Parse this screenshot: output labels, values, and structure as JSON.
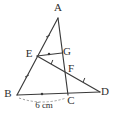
{
  "figure": {
    "type": "geometry-diagram",
    "background_color": "#ffffff",
    "stroke_color": "#3a3a3a",
    "label_color": "#2e2e2e",
    "width": 115,
    "height": 113
  },
  "points": [
    {
      "name": "A",
      "label": "A",
      "x": 58,
      "y": 18,
      "label_x": 58,
      "label_y": 11
    },
    {
      "name": "B",
      "label": "B",
      "x": 17,
      "y": 95,
      "label_x": 8,
      "label_y": 97
    },
    {
      "name": "C",
      "label": "C",
      "x": 68,
      "y": 95,
      "label_x": 71,
      "label_y": 104
    },
    {
      "name": "D",
      "label": "D",
      "x": 100,
      "y": 92,
      "label_x": 105,
      "label_y": 95
    },
    {
      "name": "E",
      "label": "E",
      "x": 37,
      "y": 56,
      "label_x": 29,
      "label_y": 57
    },
    {
      "name": "F",
      "label": "F",
      "x": 68,
      "y": 69,
      "label_x": 71,
      "label_y": 72
    },
    {
      "name": "G",
      "label": "G",
      "x": 62,
      "y": 53,
      "label_x": 67,
      "label_y": 55
    }
  ],
  "segments": [
    {
      "name": "segment-AB",
      "from": "A",
      "to": "B",
      "style": "solid"
    },
    {
      "name": "segment-AC",
      "from": "A",
      "to": "C",
      "style": "solid"
    },
    {
      "name": "segment-BD",
      "from": "B",
      "to": "D",
      "style": "solid"
    },
    {
      "name": "segment-EG",
      "from": "E",
      "to": "G",
      "style": "solid"
    },
    {
      "name": "segment-ED",
      "from": "E",
      "to": "D",
      "style": "solid"
    }
  ],
  "tick_marks": [
    {
      "name": "tick-AE",
      "x": 48,
      "y": 36,
      "angle": 62
    },
    {
      "name": "tick-EB",
      "x": 27,
      "y": 76,
      "angle": 62
    },
    {
      "name": "tick-EF",
      "x": 52,
      "y": 62,
      "angle": 22
    },
    {
      "name": "tick-FD",
      "x": 84,
      "y": 80,
      "angle": 22
    }
  ],
  "midpoint_dots": [
    {
      "name": "dot-EG-midpoint",
      "x": 49,
      "y": 54
    },
    {
      "name": "dot-BC-midpoint",
      "x": 42,
      "y": 94
    }
  ],
  "measurements": [
    {
      "name": "measure-bc",
      "label": "6 cm",
      "label_x": 44,
      "label_y": 108,
      "from": "B",
      "to": "C",
      "style": "dashed-arc"
    }
  ]
}
